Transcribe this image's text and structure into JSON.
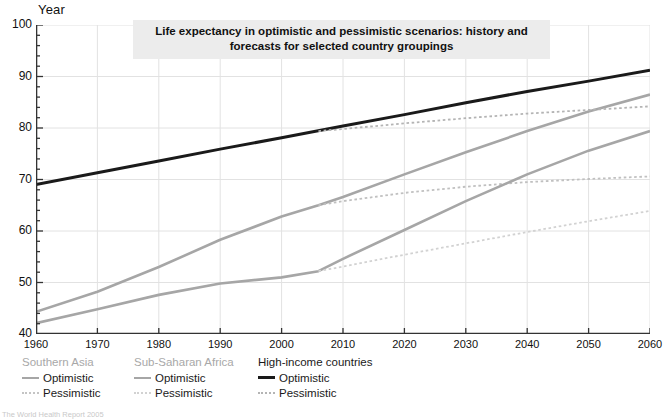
{
  "chart_data": {
    "type": "line",
    "title": "Life expectancy in optimistic and pessimistic scenarios: history and forecasts for selected country groupings",
    "title_line1": "Life expectancy in optimistic and pessimistic scenarios: history and",
    "title_line2": "forecasts for selected country groupings",
    "xlabel": "",
    "ylabel": "Year",
    "xlim": [
      1960,
      2060
    ],
    "ylim": [
      40,
      100
    ],
    "x_ticks": [
      1960,
      1970,
      1980,
      1990,
      2000,
      2010,
      2020,
      2030,
      2040,
      2050,
      2060
    ],
    "y_ticks": [
      40,
      50,
      60,
      70,
      80,
      90,
      100
    ],
    "y_minor_step": 2,
    "grid": true,
    "legend_position": "below-left",
    "series": [
      {
        "name": "Southern Asia — Optimistic",
        "group": "Southern Asia",
        "scenario": "Optimistic",
        "style": "solid",
        "color": "#a6a6a6",
        "x": [
          1960,
          1970,
          1980,
          1990,
          2000,
          2006,
          2010,
          2020,
          2030,
          2040,
          2050,
          2060
        ],
        "y": [
          44.3,
          48.2,
          53.0,
          58.3,
          62.8,
          65.0,
          66.6,
          71.0,
          75.3,
          79.4,
          83.2,
          86.5
        ]
      },
      {
        "name": "Southern Asia — Pessimistic",
        "group": "Southern Asia",
        "scenario": "Pessimistic",
        "style": "dotted",
        "color": "#c0c0c0",
        "x": [
          2006,
          2010,
          2020,
          2030,
          2040,
          2050,
          2060
        ],
        "y": [
          65.0,
          65.8,
          67.4,
          68.6,
          69.5,
          70.1,
          70.6
        ]
      },
      {
        "name": "Sub-Saharan Africa — Optimistic",
        "group": "Sub-Saharan Africa",
        "scenario": "Optimistic",
        "style": "solid",
        "color": "#a6a6a6",
        "x": [
          1960,
          1970,
          1980,
          1990,
          2000,
          2006,
          2010,
          2020,
          2030,
          2040,
          2050,
          2060
        ],
        "y": [
          42.1,
          44.8,
          47.6,
          49.8,
          51.0,
          52.2,
          54.6,
          60.2,
          65.8,
          71.0,
          75.6,
          79.4
        ]
      },
      {
        "name": "Sub-Saharan Africa — Pessimistic",
        "group": "Sub-Saharan Africa",
        "scenario": "Pessimistic",
        "style": "dotted",
        "color": "#d2d2d2",
        "x": [
          2006,
          2010,
          2020,
          2030,
          2040,
          2050,
          2060
        ],
        "y": [
          52.2,
          53.1,
          55.4,
          57.6,
          59.8,
          61.9,
          63.9
        ]
      },
      {
        "name": "High-income countries — Optimistic",
        "group": "High-income countries",
        "scenario": "Optimistic",
        "style": "solid",
        "color": "#1a1a1a",
        "x": [
          1960,
          1970,
          1980,
          1990,
          2000,
          2010,
          2020,
          2030,
          2040,
          2050,
          2060
        ],
        "y": [
          69.0,
          71.3,
          73.6,
          75.9,
          78.1,
          80.4,
          82.6,
          84.9,
          87.1,
          89.1,
          91.2
        ]
      },
      {
        "name": "High-income countries — Pessimistic",
        "group": "High-income countries",
        "scenario": "Pessimistic",
        "style": "dotted",
        "color": "#b4b4b4",
        "x": [
          2006,
          2010,
          2020,
          2030,
          2040,
          2050,
          2060
        ],
        "y": [
          79.4,
          79.8,
          80.9,
          81.9,
          82.8,
          83.5,
          84.2
        ]
      }
    ]
  },
  "axis": {
    "y_title": "Year",
    "y_tick_labels": [
      "100",
      "90",
      "80",
      "70",
      "60",
      "50",
      "40"
    ],
    "x_tick_labels": [
      "1960",
      "1970",
      "1980",
      "1990",
      "2000",
      "2010",
      "2020",
      "2030",
      "2040",
      "2050",
      "2060"
    ]
  },
  "legend": {
    "groups": [
      {
        "header": "Southern Asia",
        "header_color": "#a8a8a8",
        "rows": [
          {
            "label": "Optimistic",
            "style": "solid",
            "color": "#a6a6a6"
          },
          {
            "label": "Pessimistic",
            "style": "dotted",
            "color": "#c4c4c4"
          }
        ]
      },
      {
        "header": "Sub-Saharan Africa",
        "header_color": "#a8a8a8",
        "rows": [
          {
            "label": "Optimistic",
            "style": "solid",
            "color": "#a6a6a6"
          },
          {
            "label": "Pessimistic",
            "style": "dotted",
            "color": "#d2d2d2"
          }
        ]
      },
      {
        "header": "High-income countries",
        "header_color": "#1a1a1a",
        "rows": [
          {
            "label": "Optimistic",
            "style": "solid",
            "color": "#1a1a1a"
          },
          {
            "label": "Pessimistic",
            "style": "dotted",
            "color": "#b4b4b4"
          }
        ]
      }
    ]
  },
  "source": {
    "text": "The World Health Report 2005"
  },
  "colors": {
    "grid": "#e2e2e2",
    "axis": "#333333",
    "title_bg": "#ececec",
    "text": "#111111"
  }
}
